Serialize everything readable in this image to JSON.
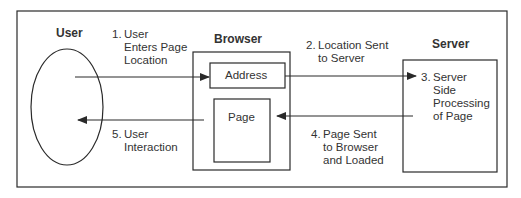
{
  "diagram": {
    "actors": {
      "user": "User",
      "browser": "Browser",
      "server": "Server"
    },
    "browser_components": {
      "address": "Address",
      "page": "Page"
    },
    "steps": [
      {
        "number": "1.",
        "text": "User\nEnters Page\nLocation"
      },
      {
        "number": "2.",
        "text": "Location Sent\nto Server"
      },
      {
        "number": "3.",
        "text": "Server\nSide\nProcessing\nof Page"
      },
      {
        "number": "4.",
        "text": "Page Sent\nto Browser\nand Loaded"
      },
      {
        "number": "5.",
        "text": "User\nInteraction"
      }
    ],
    "colors": {
      "line": "#2a2a2a",
      "background": "#ffffff"
    }
  }
}
